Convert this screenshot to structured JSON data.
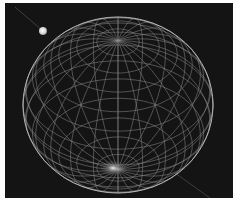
{
  "scene": {
    "description": "Wireframe sphere rendered on black background with a small glowing light source",
    "background_color": "#141414",
    "wire_color": "#9a9a9a",
    "sphere": {
      "cx": 113,
      "cy": 102,
      "rx": 95,
      "ry": 88,
      "meridians": 24,
      "parallels": 14
    },
    "pole_glow": {
      "cx": 108,
      "cy": 165
    },
    "light_source": {
      "cx": 38,
      "cy": 28,
      "r": 4,
      "color": "#e8e8e8"
    }
  }
}
